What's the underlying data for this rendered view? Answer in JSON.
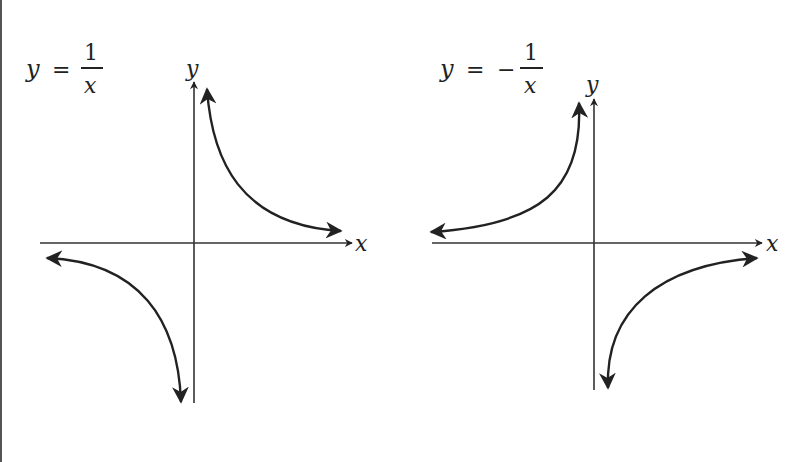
{
  "graphs": [
    {
      "equation": {
        "lhs": "y",
        "eq": "=",
        "sign": "",
        "numerator": "1",
        "denominator": "x"
      },
      "axis_labels": {
        "x": "x",
        "y": "y"
      },
      "origin": [
        194,
        243
      ]
    },
    {
      "equation": {
        "lhs": "y",
        "eq": "=",
        "sign": "−",
        "numerator": "1",
        "denominator": "x"
      },
      "axis_labels": {
        "x": "x",
        "y": "y"
      },
      "origin": [
        594,
        243
      ]
    }
  ],
  "colors": {
    "stroke": "#222222",
    "border": "#555555",
    "background": "#ffffff"
  }
}
